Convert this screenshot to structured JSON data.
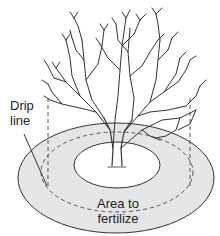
{
  "diagram": {
    "labels": {
      "drip_line": [
        "Drip",
        "line"
      ],
      "area": [
        "Area to",
        "fertilize"
      ]
    },
    "colors": {
      "ring_fill": "#e6e6e6",
      "inner_fill": "#ffffff",
      "stroke": "#333333",
      "text": "#222222"
    }
  }
}
